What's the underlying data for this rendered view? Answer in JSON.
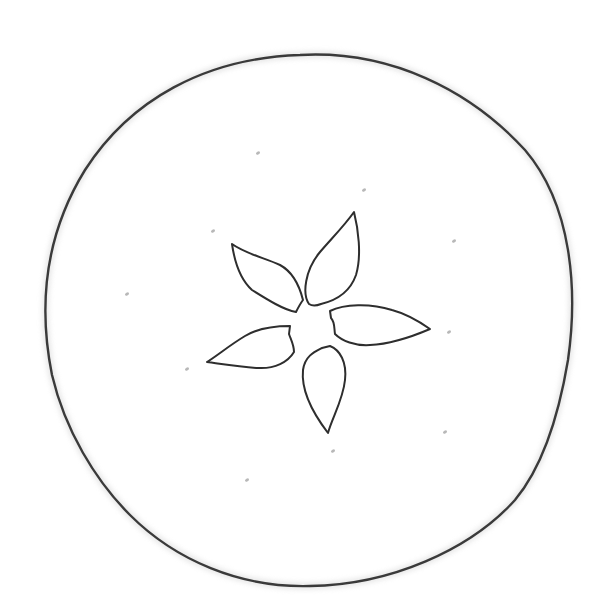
{
  "image": {
    "subject": "persimmon top view line drawing",
    "width": 605,
    "height": 603,
    "background": "#ffffff",
    "stroke_color": "#3a3a3a",
    "speck_color": "#b8b8b8"
  },
  "fruit_outline": {
    "path": "M 300 55 C 390 50, 470 90, 525 150 C 572 205, 578 290, 568 360 C 558 420, 540 470, 515 500 C 470 550, 390 585, 310 586 C 240 588, 175 560, 130 515 C 95 480, 65 430, 52 375 C 38 305, 45 235, 85 170 C 130 100, 205 58, 300 55 Z"
  },
  "calyx": {
    "center": [
      314,
      320
    ],
    "sepals": [
      {
        "name": "sepal-top",
        "path": "M 309 304 C 302 294, 305 270, 320 252 C 332 238, 345 225, 354 212 C 358 228, 362 255, 356 275 C 350 292, 338 300, 321 304 C 316 306, 312 306, 309 304 Z"
      },
      {
        "name": "sepal-right",
        "path": "M 330 311 C 344 304, 370 303, 392 310 C 407 314, 420 322, 430 329 C 416 335, 392 344, 370 345 C 355 346, 342 341, 335 334 C 334 328, 335 322, 331 318 Z"
      },
      {
        "name": "sepal-bottom",
        "path": "M 322 348 C 314 352, 305 356, 303 370 C 301 390, 312 412, 328 433 C 332 418, 343 400, 345 380 C 347 362, 340 350, 330 346 Z"
      },
      {
        "name": "sepal-left",
        "path": "M 290 326 C 276 326, 258 328, 245 336 C 230 345, 218 355, 207 362 C 222 364, 240 367, 258 368 C 275 369, 288 362, 294 352 C 294 345, 291 340, 289 334 Z"
      },
      {
        "name": "sepal-upper-left",
        "path": "M 296 312 C 284 310, 268 300, 252 290 C 241 280, 235 265, 232 244 C 246 254, 265 258, 280 265 C 293 272, 300 288, 303 300 C 300 304, 298 308, 296 312 Z"
      }
    ]
  },
  "specks": [
    [
      258,
      153
    ],
    [
      213,
      231
    ],
    [
      127,
      294
    ],
    [
      187,
      369
    ],
    [
      364,
      190
    ],
    [
      454,
      241
    ],
    [
      449,
      332
    ],
    [
      445,
      432
    ],
    [
      333,
      451
    ],
    [
      247,
      480
    ]
  ]
}
